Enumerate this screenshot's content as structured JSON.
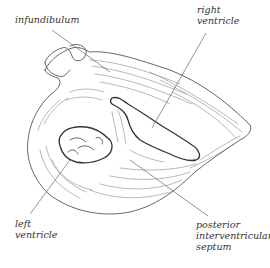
{
  "diagram": {
    "line_color": "#444444",
    "labels": [
      {
        "id": "infundibulum",
        "lines": [
          "infundibulum"
        ]
      },
      {
        "id": "right-ventricle",
        "lines": [
          "right",
          "ventricle"
        ]
      },
      {
        "id": "left-ventricle",
        "lines": [
          "left",
          "ventricle"
        ]
      },
      {
        "id": "posterior-interventricular-septum",
        "lines": [
          "posterior",
          "interventricular",
          "septum"
        ]
      }
    ]
  }
}
